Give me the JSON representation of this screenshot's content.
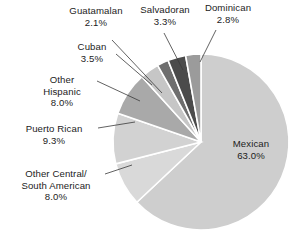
{
  "chart_data": {
    "type": "pie",
    "title": "",
    "subtitle": "",
    "xlabel": "",
    "ylabel": "",
    "legend_position": "none",
    "grid": false,
    "labels_outside": true,
    "total_percent": "100.0%",
    "categories": [
      "Mexican",
      "Puerto Rican",
      "Other Central/ South American",
      "Other Hispanic",
      "Cuban",
      "Salvadoran",
      "Dominican",
      "Guatamalan"
    ],
    "values": [
      63.0,
      9.3,
      8.0,
      8.0,
      3.5,
      3.3,
      2.8,
      2.1
    ],
    "slices": [
      {
        "name": "Mexican",
        "label": "Mexican",
        "value": 63.0,
        "value_label": "63.0%",
        "color": "#cecece",
        "label_placement": "inside-right"
      },
      {
        "name": "other-central-south-american",
        "label": "Other Central/",
        "label_line2": "South American",
        "value": 8.0,
        "value_label": "8.0%",
        "color": "#d9d9d9",
        "label_placement": "outside-left"
      },
      {
        "name": "puerto-rican",
        "label": "Puerto Rican",
        "value": 9.3,
        "value_label": "9.3%",
        "color": "#d2d2d2",
        "label_placement": "outside-left"
      },
      {
        "name": "other-hispanic",
        "label": "Other",
        "label_line2": "Hispanic",
        "value": 8.0,
        "value_label": "8.0%",
        "color": "#a9a9a9",
        "label_placement": "outside-left"
      },
      {
        "name": "cuban",
        "label": "Cuban",
        "value": 3.5,
        "value_label": "3.5%",
        "color": "#c6c6c6",
        "label_placement": "outside-upper-left"
      },
      {
        "name": "guatamalan",
        "label": "Guatamalan",
        "value": 2.1,
        "value_label": "2.1%",
        "color": "#6e6e6e",
        "label_placement": "outside-top"
      },
      {
        "name": "salvadoran",
        "label": "Salvadoran",
        "value": 3.3,
        "value_label": "3.3%",
        "color": "#4b4b4b",
        "label_placement": "outside-top"
      },
      {
        "name": "dominican",
        "label": "Dominican",
        "value": 2.8,
        "value_label": "2.8%",
        "color": "#9b9b9b",
        "label_placement": "outside-top-right"
      }
    ],
    "geometry": {
      "center_x": 201,
      "center_y": 142,
      "radius": 88,
      "start_angle_deg": 0,
      "direction": "clockwise",
      "slice_gap_color": "#ffffff"
    }
  },
  "labels": {
    "guatamalan": {
      "name": "Guatamalan",
      "pct": "2.1%"
    },
    "salvadoran": {
      "name": "Salvadoran",
      "pct": "3.3%"
    },
    "dominican": {
      "name": "Dominican",
      "pct": "2.8%"
    },
    "cuban": {
      "name": "Cuban",
      "pct": "3.5%"
    },
    "other_hispanic": {
      "name": "Other",
      "name2": "Hispanic",
      "pct": "8.0%"
    },
    "puerto_rican": {
      "name": "Puerto Rican",
      "pct": "9.3%"
    },
    "other_csa": {
      "name": "Other Central/",
      "name2": "South American",
      "pct": "8.0%"
    },
    "mexican": {
      "name": "Mexican",
      "pct": "63.0%"
    }
  }
}
